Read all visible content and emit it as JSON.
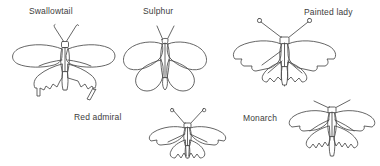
{
  "figure": {
    "background_color": "#ffffff",
    "line_color": "#4a4a4a",
    "text_color": "#3c3c3c",
    "width": 380,
    "height": 166
  },
  "species": [
    {
      "id": "swallowtail",
      "label": "Swallowtail",
      "label_x": 29,
      "label_y": 6,
      "drawing_x": 10,
      "drawing_y": 20,
      "row": "top",
      "column": 1,
      "wing_shape": "elongated forewings with tailed hindwings",
      "antennae": "thin, slightly hooked"
    },
    {
      "id": "sulphur",
      "label": "Sulphur",
      "label_x": 143,
      "label_y": 6,
      "drawing_x": 119,
      "drawing_y": 20,
      "row": "top",
      "column": 2,
      "wing_shape": "broad rounded oval wings",
      "antennae": "short straight"
    },
    {
      "id": "painted-lady",
      "label": "Painted lady",
      "label_x": 304,
      "label_y": 7,
      "drawing_x": 232,
      "drawing_y": 16,
      "row": "top",
      "column": 3,
      "wing_shape": "angular scalloped forewings",
      "antennae": "club-tipped"
    },
    {
      "id": "red-admiral",
      "label": "Red admiral",
      "label_x": 74,
      "label_y": 112,
      "drawing_x": 148,
      "drawing_y": 108,
      "row": "bottom",
      "column": 1,
      "wing_shape": "pointed forewings with notched edges",
      "antennae": "long club-tipped"
    },
    {
      "id": "monarch",
      "label": "Monarch",
      "label_x": 243,
      "label_y": 113,
      "drawing_x": 288,
      "drawing_y": 100,
      "row": "bottom",
      "column": 2,
      "wing_shape": "wide triangular forewings with scalloped hindwings",
      "antennae": "thin splayed"
    }
  ]
}
